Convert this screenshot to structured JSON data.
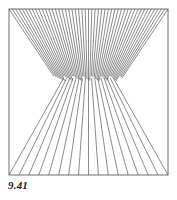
{
  "figure": {
    "caption": "9.41",
    "frame": {
      "x": 9,
      "y": 9,
      "width": 159,
      "height": 166,
      "stroke_color": "#4a4a4a",
      "stroke_width": 0.8,
      "fill_color": "#ffffff"
    },
    "line_color": "#5a5a5a",
    "line_width": 0.7,
    "background_color": "#ffffff",
    "horizon_y": 80
  },
  "chart_data": {
    "type": "line",
    "title": "9.41",
    "subtitle": "",
    "xlabel": "",
    "ylabel": "",
    "xlim": [
      9,
      168
    ],
    "ylim": [
      9,
      175
    ],
    "grid": false,
    "legend": null,
    "annotations": [
      {
        "text": "9.41",
        "x": 8,
        "y": 179,
        "style": "bold-italic"
      }
    ],
    "series": [
      {
        "name": "upper-fan",
        "type": "ray-fan",
        "count": 49,
        "vanishing_point": {
          "x": 88.5,
          "y": 128
        },
        "start_y": 9,
        "end_y": 80,
        "x_start": 9,
        "x_end": 168,
        "note": "Rays start evenly spaced along the top border and converge downward toward the vanishing point, terminating at the horizon."
      },
      {
        "name": "lower-fan",
        "type": "ray-fan",
        "count": 17,
        "vanishing_point": {
          "x": 88.5,
          "y": 34
        },
        "start_y": 78,
        "end_y": 175,
        "x_start": 9,
        "x_end": 168,
        "note": "Rays start along the horizon and diverge downward to the bottom border, spacing widening with depth."
      }
    ]
  }
}
